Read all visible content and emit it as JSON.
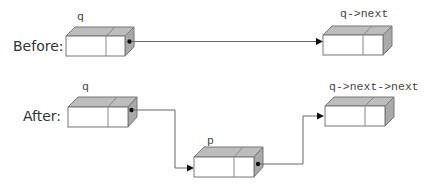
{
  "diagram": {
    "type": "linked-list-node-insertion",
    "rows": {
      "before": {
        "label": "Before:"
      },
      "after": {
        "label": "After:"
      }
    },
    "nodes": {
      "before_q": {
        "label": "q"
      },
      "before_q_next": {
        "label": "q->next"
      },
      "after_q": {
        "label": "q"
      },
      "after_p": {
        "label": "p"
      },
      "after_q_next_next": {
        "label": "q->next->next"
      }
    },
    "links": [
      {
        "from": "before_q",
        "to": "before_q_next"
      },
      {
        "from": "after_q",
        "to": "after_p"
      },
      {
        "from": "after_p",
        "to": "after_q_next_next"
      }
    ],
    "colors": {
      "top_face": "#bdbdbd",
      "side_face": "#a9a9a9",
      "front_face": "#ffffff",
      "outline": "#777777",
      "link": "#666666",
      "pointer_dot": "#111111"
    }
  }
}
